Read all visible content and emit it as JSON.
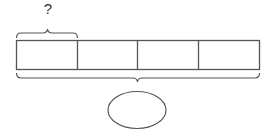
{
  "diagram": {
    "type": "tape-diagram",
    "segments": 4,
    "part_label": "?",
    "total_label": "",
    "stroke_color": "#555555",
    "background": "#ffffff"
  }
}
